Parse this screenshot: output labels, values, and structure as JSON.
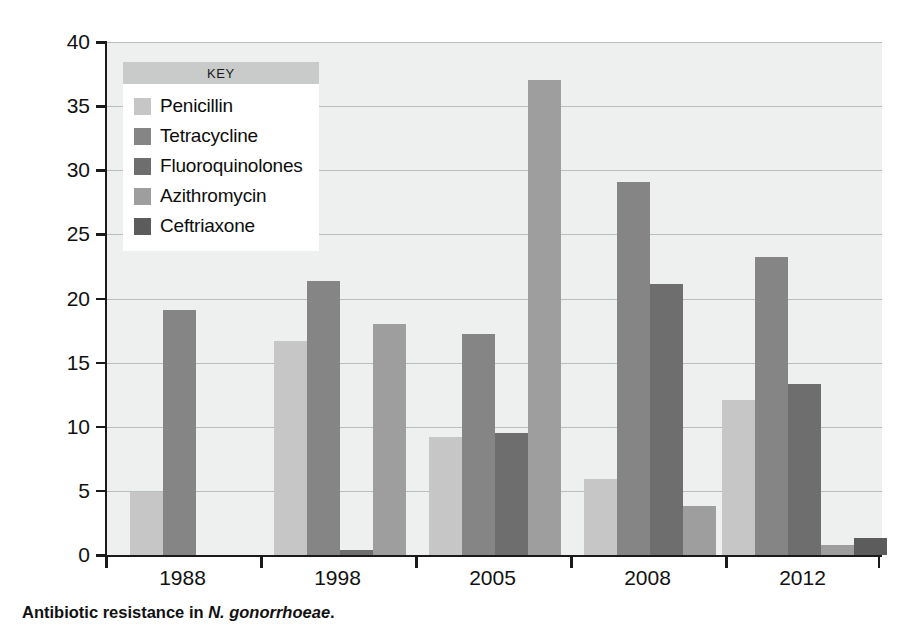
{
  "chart_data": {
    "type": "bar",
    "title": "",
    "xlabel": "",
    "ylabel": "Percentage of resistant isolates",
    "categories": [
      "1988",
      "1998",
      "2005",
      "2008",
      "2012"
    ],
    "ylim": [
      0,
      40
    ],
    "yticks": [
      0,
      5,
      10,
      15,
      20,
      25,
      30,
      35,
      40
    ],
    "grid": true,
    "legend_position": "upper-left-inside",
    "legend_title": "KEY",
    "series": [
      {
        "name": "Penicillin",
        "color": "#c6c6c6",
        "values": [
          4.9,
          16.7,
          9.2,
          5.9,
          12.1
        ]
      },
      {
        "name": "Tetracycline",
        "color": "#858585",
        "values": [
          19.1,
          21.4,
          17.2,
          29.1,
          23.2
        ]
      },
      {
        "name": "Fluoroquinolones",
        "color": "#6e6e6e",
        "values": [
          null,
          0.4,
          9.5,
          21.1,
          13.3
        ]
      },
      {
        "name": "Azithromycin",
        "color": "#9e9e9e",
        "values": [
          null,
          18.0,
          37.0,
          3.8,
          0.8
        ]
      },
      {
        "name": "Ceftriaxone",
        "color": "#5c5c5c",
        "values": [
          null,
          null,
          null,
          null,
          1.3
        ]
      }
    ]
  },
  "legend": {
    "title": "KEY",
    "items": [
      {
        "label": "Penicillin",
        "color": "#c6c6c6"
      },
      {
        "label": "Tetracycline",
        "color": "#858585"
      },
      {
        "label": "Fluoroquinolones",
        "color": "#6e6e6e"
      },
      {
        "label": "Azithromycin",
        "color": "#9e9e9e"
      },
      {
        "label": "Ceftriaxone",
        "color": "#5c5c5c"
      }
    ]
  },
  "axes": {
    "y_title": "Percentage of resistant isolates",
    "y_tick_labels": [
      "0",
      "5",
      "10",
      "15",
      "20",
      "25",
      "30",
      "35",
      "40"
    ],
    "x_tick_labels": [
      "1988",
      "1998",
      "2005",
      "2008",
      "2012"
    ]
  },
  "caption": {
    "prefix": "Antibiotic resistance in ",
    "species": "N. gonorrhoeae",
    "suffix": "."
  },
  "colors": {
    "plot_background": "#eef0ef",
    "gridline": "#b9bdbb",
    "axis": "#1a1a1a",
    "legend_header": "#c9cbca",
    "legend_background": "#ffffff"
  }
}
